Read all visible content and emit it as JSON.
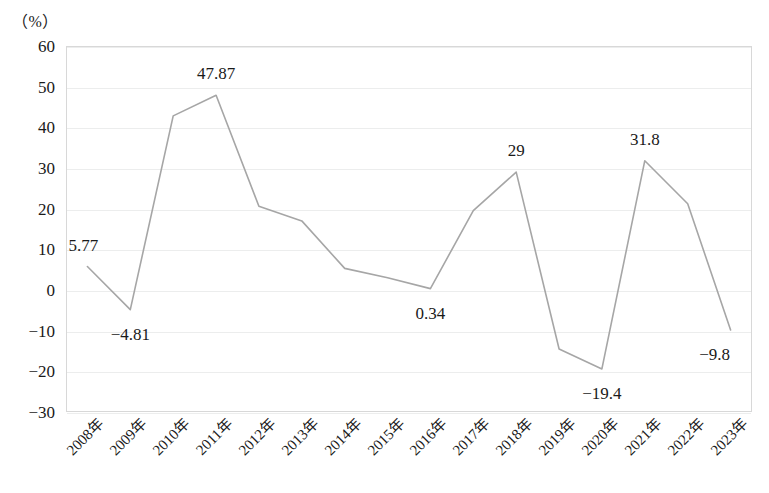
{
  "axis": {
    "unit_caption": "（%）",
    "y_ticks": [
      "60",
      "50",
      "40",
      "30",
      "20",
      "10",
      "0",
      "−10",
      "−20",
      "−30"
    ]
  },
  "chart_data": {
    "type": "line",
    "title": "",
    "subtitle": "",
    "xlabel": "",
    "ylabel": "（%）",
    "ylim": [
      -30,
      60
    ],
    "ytick_step": 10,
    "grid": true,
    "legend": "none",
    "line_color": "#a6a6a6",
    "categories": [
      "2008年",
      "2009年",
      "2010年",
      "2011年",
      "2012年",
      "2013年",
      "2014年",
      "2015年",
      "2016年",
      "2017年",
      "2018年",
      "2019年",
      "2020年",
      "2021年",
      "2022年",
      "2023年"
    ],
    "values": [
      5.77,
      -4.81,
      42.8,
      47.87,
      20.6,
      17.0,
      5.3,
      3.0,
      0.34,
      19.5,
      29,
      -14.5,
      -19.4,
      31.8,
      21.2,
      -9.8
    ],
    "point_labels": [
      {
        "category": "2008年",
        "value": 5.77,
        "text": "5.77",
        "position": "above-left"
      },
      {
        "category": "2009年",
        "value": -4.81,
        "text": "−4.81",
        "position": "below"
      },
      {
        "category": "2011年",
        "value": 47.87,
        "text": "47.87",
        "position": "above"
      },
      {
        "category": "2016年",
        "value": 0.34,
        "text": "0.34",
        "position": "below"
      },
      {
        "category": "2018年",
        "value": 29,
        "text": "29",
        "position": "above"
      },
      {
        "category": "2020年",
        "value": -19.4,
        "text": "−19.4",
        "position": "below"
      },
      {
        "category": "2021年",
        "value": 31.8,
        "text": "31.8",
        "position": "above"
      },
      {
        "category": "2023年",
        "value": -9.8,
        "text": "−9.8",
        "position": "below-left"
      }
    ]
  }
}
